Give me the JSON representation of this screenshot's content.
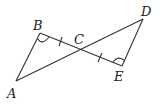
{
  "diagram": {
    "type": "geometry",
    "points": {
      "A": {
        "label": "A",
        "x": 16,
        "y": 81,
        "lx": 7,
        "ly": 98
      },
      "B": {
        "label": "B",
        "x": 40,
        "y": 33,
        "lx": 33,
        "ly": 30
      },
      "C": {
        "label": "C",
        "x": 80,
        "y": 50,
        "lx": 74,
        "ly": 44
      },
      "D": {
        "label": "D",
        "x": 143,
        "y": 19,
        "lx": 141,
        "ly": 16
      },
      "E": {
        "label": "E",
        "x": 122,
        "y": 66,
        "lx": 114,
        "ly": 81
      }
    },
    "segments": [
      "AB",
      "BE",
      "AD",
      "DE"
    ],
    "tick_marks": [
      "BC",
      "CE"
    ],
    "angle_marks": [
      "B",
      "E"
    ],
    "stroke_color": "#333333"
  }
}
